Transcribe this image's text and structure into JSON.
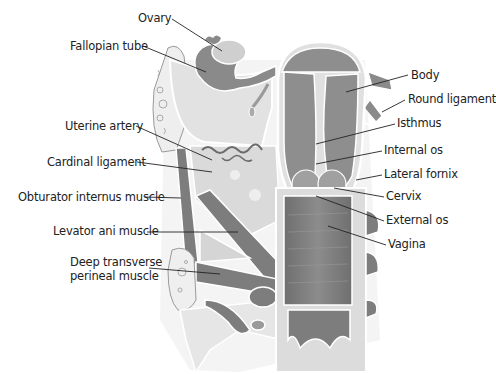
{
  "diagram": {
    "type": "anatomical illustration",
    "labels_left": [
      {
        "text": "Ovary",
        "x": 138,
        "y": 12
      },
      {
        "text": "Fallopian tube",
        "x": 70,
        "y": 40
      },
      {
        "text": "Uterine artery",
        "x": 65,
        "y": 120
      },
      {
        "text": "Cardinal ligament",
        "x": 47,
        "y": 156
      },
      {
        "text": "Obturator internus muscle",
        "x": 18,
        "y": 191
      },
      {
        "text": "Levator ani muscle",
        "x": 53,
        "y": 225
      },
      {
        "text": "Deep transverse",
        "x": 70,
        "y": 256
      },
      {
        "text": "perineal muscle",
        "x": 70,
        "y": 270
      }
    ],
    "labels_right": [
      {
        "text": "Body",
        "x": 411,
        "y": 69
      },
      {
        "text": "Round ligament",
        "x": 408,
        "y": 93
      },
      {
        "text": "Isthmus",
        "x": 397,
        "y": 117
      },
      {
        "text": "Internal os",
        "x": 384,
        "y": 144
      },
      {
        "text": "Lateral fornix",
        "x": 384,
        "y": 168
      },
      {
        "text": "Cervix",
        "x": 386,
        "y": 190
      },
      {
        "text": "External os",
        "x": 386,
        "y": 214
      },
      {
        "text": "Vagina",
        "x": 388,
        "y": 238
      }
    ],
    "colors": {
      "muscle": "#7d7d7d",
      "tissue_light": "#e4e4e4",
      "tissue_mid": "#b9b9b9",
      "outline": "#ffffff",
      "leader": "#222222",
      "text": "#222222"
    }
  }
}
